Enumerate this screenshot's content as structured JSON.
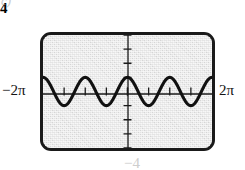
{
  "figure": {
    "part_label": "c)",
    "window": {
      "ymax_label": "4",
      "ymin_label": "−4",
      "xmin_label": "−2π",
      "xmax_label": "2π"
    }
  },
  "chart_data": {
    "type": "line",
    "title": "",
    "xlabel": "",
    "ylabel": "",
    "function": "y = cos(2x)",
    "amplitude": 1,
    "period": 3.14159,
    "cycles_shown": 4,
    "xlim": [
      -6.28319,
      6.28319
    ],
    "ylim": [
      -4,
      4
    ],
    "xtick_labels": [
      "−2π",
      "2π"
    ],
    "ytick_labels": [
      "4",
      "−4"
    ],
    "xtick_step": 1.5708,
    "ytick_step": 1,
    "grid": false,
    "legend": false,
    "x": [
      -6.28319,
      -5.89049,
      -5.49779,
      -5.10509,
      -4.71239,
      -4.31969,
      -3.92699,
      -3.53429,
      -3.14159,
      -2.74889,
      -2.35619,
      -1.9635,
      -1.5708,
      -1.1781,
      -0.7854,
      -0.3927,
      0,
      0.3927,
      0.7854,
      1.1781,
      1.5708,
      1.9635,
      2.35619,
      2.74889,
      3.14159,
      3.53429,
      3.92699,
      4.31969,
      4.71239,
      5.10509,
      5.49779,
      5.89049,
      6.28319
    ],
    "y": [
      1,
      0.70711,
      0,
      -0.70711,
      -1,
      -0.70711,
      0,
      0.70711,
      1,
      0.70711,
      0,
      -0.70711,
      -1,
      -0.70711,
      0,
      0.70711,
      1,
      0.70711,
      0,
      -0.70711,
      -1,
      -0.70711,
      0,
      0.70711,
      1,
      0.70711,
      0,
      -0.70711,
      -1,
      -0.70711,
      0,
      0.70711,
      1
    ]
  }
}
